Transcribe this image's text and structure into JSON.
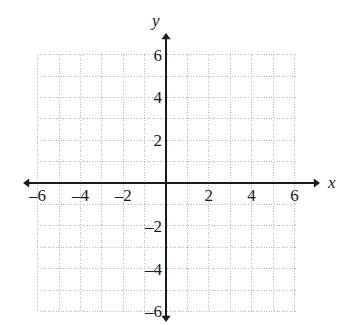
{
  "figure": {
    "type": "cartesian-coordinate-grid",
    "background_color": "#ffffff",
    "grid_color": "#b8b8b8",
    "axis_color": "#1a1a1a",
    "label_color": "#1a1a1a"
  },
  "axes": {
    "x": {
      "name": "x",
      "min": -6,
      "max": 6,
      "step": 1,
      "label_step": 2,
      "arrow_start": true,
      "arrow_end": true,
      "tick_labels": [
        "–6",
        "–4",
        "–2",
        "2",
        "4",
        "6"
      ],
      "tick_values": [
        -6,
        -4,
        -2,
        2,
        4,
        6
      ]
    },
    "y": {
      "name": "y",
      "min": -6,
      "max": 6,
      "step": 1,
      "label_step": 2,
      "arrow_start": true,
      "arrow_end": true,
      "tick_labels": [
        "6",
        "4",
        "2",
        "–2",
        "–4",
        "–6"
      ],
      "tick_values": [
        6,
        4,
        2,
        -2,
        -4,
        -6
      ]
    }
  },
  "geometry": {
    "origin_x": 166,
    "origin_y": 183,
    "unit_px": 21.4,
    "grid_left": 40,
    "grid_right": 297,
    "grid_top": 55,
    "grid_bottom": 312,
    "x_axis_arrow_left": 23,
    "x_axis_arrow_right": 320,
    "y_axis_arrow_top": 33,
    "y_axis_arrow_bottom": 322
  },
  "chart_data": {
    "type": "scatter",
    "title": "",
    "xlabel": "x",
    "ylabel": "y",
    "xlim": [
      -6,
      6
    ],
    "ylim": [
      -6,
      6
    ],
    "grid": true,
    "legend": false,
    "series": [],
    "x_ticks": [
      -6,
      -4,
      -2,
      2,
      4,
      6
    ],
    "y_ticks": [
      -6,
      -4,
      -2,
      2,
      4,
      6
    ]
  }
}
